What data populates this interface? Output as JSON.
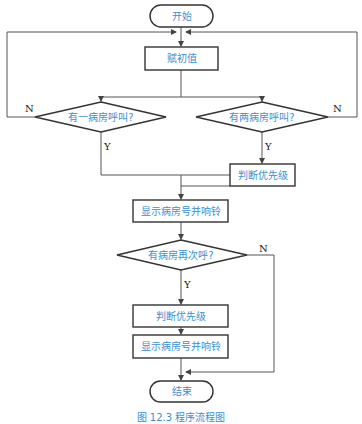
{
  "diagram": {
    "type": "flowchart",
    "nodes": {
      "start": {
        "shape": "terminal",
        "label": "开始"
      },
      "init": {
        "shape": "process",
        "label": "赋初值"
      },
      "decision_one": {
        "shape": "decision",
        "label": "有一病房呼叫?"
      },
      "decision_two": {
        "shape": "decision",
        "label": "有两病房呼叫?"
      },
      "priority_right": {
        "shape": "process",
        "label": "判断优先级"
      },
      "display_first": {
        "shape": "process",
        "label": "显示病房号并响铃"
      },
      "decision_again": {
        "shape": "decision",
        "label": "有病房再次呼?"
      },
      "priority_bottom": {
        "shape": "process",
        "label": "判断优先级"
      },
      "display_second": {
        "shape": "process",
        "label": "显示病房号并响铃"
      },
      "end": {
        "shape": "terminal",
        "label": "结束"
      }
    },
    "edge_labels": {
      "one_no": "N",
      "one_yes": "Y",
      "two_no": "N",
      "two_yes": "Y",
      "again_no": "N",
      "again_yes": "Y"
    },
    "edges": [
      {
        "from": "start",
        "to": "init"
      },
      {
        "from": "init",
        "to": "decision_one"
      },
      {
        "from": "init",
        "to": "decision_two"
      },
      {
        "from": "decision_one",
        "to": "init",
        "label": "N"
      },
      {
        "from": "decision_two",
        "to": "init",
        "label": "N"
      },
      {
        "from": "decision_one",
        "to": "display_first",
        "label": "Y"
      },
      {
        "from": "decision_two",
        "to": "priority_right",
        "label": "Y"
      },
      {
        "from": "priority_right",
        "to": "display_first"
      },
      {
        "from": "display_first",
        "to": "decision_again"
      },
      {
        "from": "decision_again",
        "to": "priority_bottom",
        "label": "Y"
      },
      {
        "from": "decision_again",
        "to": "end",
        "label": "N"
      },
      {
        "from": "priority_bottom",
        "to": "display_second"
      },
      {
        "from": "display_second",
        "to": "end"
      }
    ],
    "colors": {
      "text": "#3a8fd4",
      "stroke": "#333333",
      "connector": "#555555"
    }
  },
  "caption": "图 12.3   程序流程图"
}
